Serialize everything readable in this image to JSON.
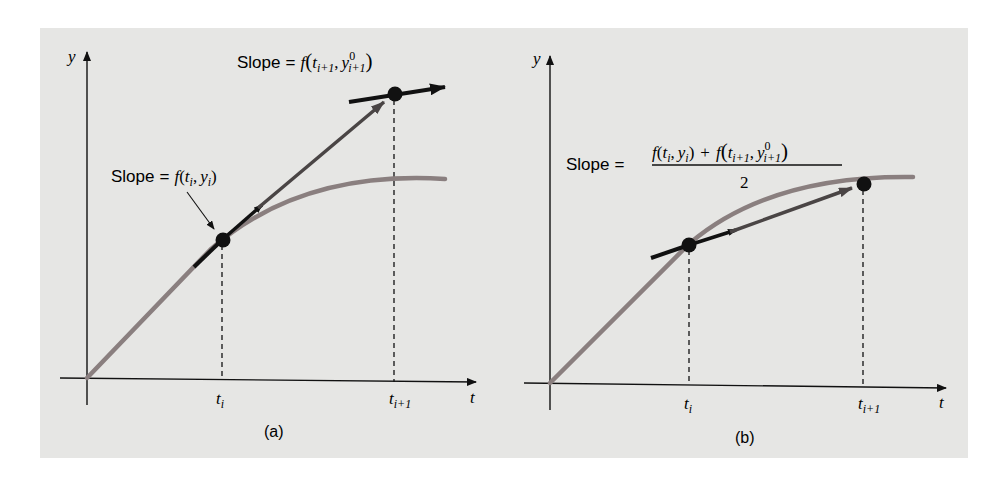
{
  "figure": {
    "background_color": "#e6e6e4",
    "curve_color": "#8a7f7f",
    "ink_color": "#111111",
    "panels": [
      {
        "id": "a",
        "caption": "(a)",
        "axes": {
          "x_label": "t",
          "y_label": "y"
        },
        "ticks": [
          {
            "base": "t",
            "sub": "i"
          },
          {
            "base": "t",
            "sub": "i+1"
          }
        ],
        "annotations": [
          {
            "id": "slope-start",
            "prefix": "Slope = ",
            "expr": "f(t_i, y_i)",
            "text": "Slope = f(t_i, y_i)"
          },
          {
            "id": "slope-end",
            "prefix": "Slope = ",
            "expr": "f(t_{i+1}, y^0_{i+1})",
            "text": "Slope = f(t_{i+1}, y^0_{i+1})"
          }
        ]
      },
      {
        "id": "b",
        "caption": "(b)",
        "axes": {
          "x_label": "t",
          "y_label": "y"
        },
        "ticks": [
          {
            "base": "t",
            "sub": "i"
          },
          {
            "base": "t",
            "sub": "i+1"
          }
        ],
        "annotations": [
          {
            "id": "slope-average",
            "prefix": "Slope = ",
            "numerator": "f(t_i, y_i) + f(t_{i+1}, y^0_{i+1})",
            "denominator": "2",
            "text": "Slope = [f(t_i, y_i) + f(t_{i+1}, y^0_{i+1})] / 2"
          }
        ]
      }
    ]
  },
  "labels": {
    "slope": "Slope",
    "eq": "=",
    "f": "f",
    "t": "t",
    "y": "y",
    "i": "i",
    "ip1": "i+1",
    "sup0": "0",
    "comma": ",",
    "lparen": "(",
    "rparen": ")",
    "plus": "+",
    "two": "2",
    "cap_a": "(a)",
    "cap_b": "(b)"
  }
}
